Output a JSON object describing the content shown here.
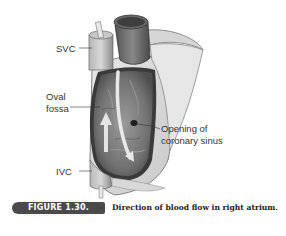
{
  "figure": {
    "label": "FIGURE 1.30.",
    "caption": "Direction of blood flow in right atrium.",
    "illustration": "right-atrium-anatomy",
    "annotations": {
      "svc": "SVC",
      "oval_fossa_line1": "Oval",
      "oval_fossa_line2": "fossa",
      "ivc": "IVC",
      "coronary_line1": "Opening of",
      "coronary_line2": "coronary sinus"
    },
    "colors": {
      "label_bg": "#4a4a4a",
      "label_text": "#ffffff",
      "caption_text": "#222222",
      "vessel_gray": "#9a9a9a",
      "interior_dark": "#6e6e6e"
    }
  }
}
